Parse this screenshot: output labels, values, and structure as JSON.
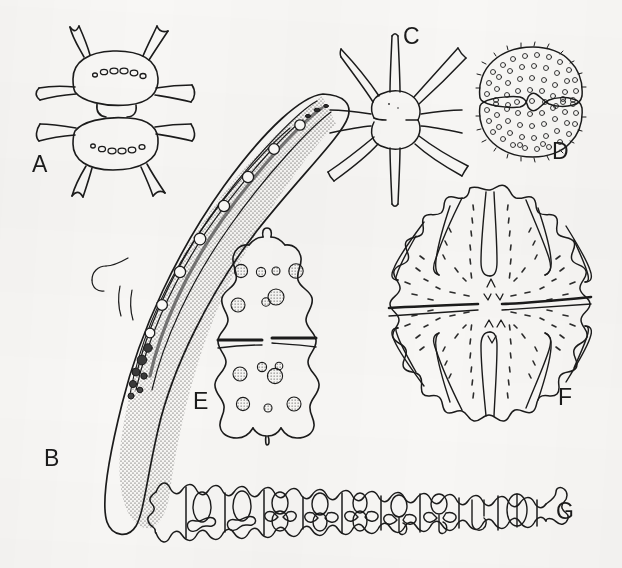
{
  "figure": {
    "kind": "scientific-illustration-plate",
    "background_color": "#f8f7f5",
    "ink_color": "#1b1b1b",
    "width": 622,
    "height": 568,
    "panel_count": 7
  },
  "labels": {
    "a": "A",
    "b": "B",
    "c": "C",
    "d": "D",
    "e": "E",
    "f": "F",
    "g": "G"
  },
  "panels": [
    {
      "id": "a",
      "label": "A",
      "name": "xanthidium-desmid",
      "description": "Biradiate desmid with two semicells joined at a narrow isthmus; four stout bifid spines per semicell and a transverse row of granules across each semicell face.",
      "label_x": 32,
      "label_y": 153,
      "spine_count": 8,
      "granule_rows": 2
    },
    {
      "id": "b",
      "label": "B",
      "name": "closterium-desmid",
      "description": "Large lunate (crescent-shaped) desmid; stippled ribbon chloroplasts flanking an axial series of pyrenoids, dark terminal granule cluster, tapering to blunt apices.",
      "label_x": 44,
      "label_y": 447,
      "pyrenoid_count": 8
    },
    {
      "id": "c",
      "label": "C",
      "name": "staurastrum-desmid",
      "description": "Stellate desmid in vertical view; two semicells each bearing long attenuate processes radiating from an inflated body, joined by a deep constriction.",
      "label_x": 403,
      "label_y": 25,
      "process_count": 6
    },
    {
      "id": "d",
      "label": "D",
      "name": "cosmarium-desmid",
      "description": "Rounded-quadrate desmid with crenulate margin, deep linear sinus, and surface uniformly covered in small annular granules (pores).",
      "label_x": 552,
      "label_y": 140,
      "granule_count": 96
    },
    {
      "id": "e",
      "label": "E",
      "name": "euastrum-desmid",
      "description": "Deeply undulate desmid with apical incision, lobed lateral margins, median sinus marked by two short bars, and symmetric scattered stippled granules.",
      "label_x": 193,
      "label_y": 390,
      "granule_count": 12
    },
    {
      "id": "f",
      "label": "F",
      "name": "micrasterias-desmid",
      "description": "Large flattened discoid desmid; deeply incised radiating lobes ending in paired dentate teeth, radial rows of dash-like pits, and a narrow median isthmus with linear sinus.",
      "label_x": 558,
      "label_y": 386,
      "lobe_count": 10
    },
    {
      "id": "g",
      "label": "G",
      "name": "desmidium-filament",
      "description": "Filamentous colonial desmid; a straight chain of short cells with crenulate lateral margins, transverse septa, and axial chloroplasts with lobed butterfly-like plates.",
      "label_x": 556,
      "label_y": 500,
      "cell_count": 11
    }
  ]
}
